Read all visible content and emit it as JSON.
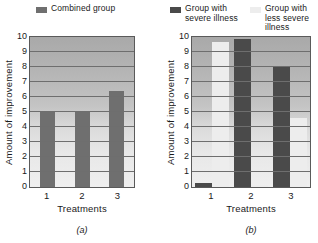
{
  "chart_data": [
    {
      "type": "bar",
      "panel": "(a)",
      "title": "",
      "categories": [
        "1",
        "2",
        "3"
      ],
      "series": [
        {
          "name": "Combined group",
          "values": [
            5.0,
            5.0,
            6.4
          ],
          "color": "#6f6f6f"
        }
      ],
      "xlabel": "Treatments",
      "ylabel": "Amount of improvement",
      "ylim": [
        0,
        10
      ],
      "yticks": [
        0,
        1,
        2,
        3,
        4,
        5,
        6,
        7,
        8,
        9,
        10
      ],
      "grid": true,
      "legend_position": "top"
    },
    {
      "type": "bar",
      "panel": "(b)",
      "title": "",
      "categories": [
        "1",
        "2",
        "3"
      ],
      "series": [
        {
          "name": "Group with\nsevere illness",
          "values": [
            0.3,
            9.85,
            8.0
          ],
          "color": "#4a4a4a"
        },
        {
          "name": "Group with\nless severe\nillness",
          "values": [
            9.7,
            0.15,
            4.6
          ],
          "color": "#ededed"
        }
      ],
      "xlabel": "Treatments",
      "ylabel": "Amount of improvement",
      "ylim": [
        0,
        10
      ],
      "yticks": [
        0,
        1,
        2,
        3,
        4,
        5,
        6,
        7,
        8,
        9,
        10
      ],
      "grid": true,
      "legend_position": "top"
    }
  ],
  "panel_a": {
    "legend": [
      {
        "label": "Combined group",
        "color": "#6f6f6f"
      }
    ],
    "ylabel": "Amount of improvement",
    "xlabel": "Treatments",
    "yticks": [
      "10",
      "9",
      "8",
      "7",
      "6",
      "5",
      "4",
      "3",
      "2",
      "1",
      "0"
    ],
    "xticks": [
      "1",
      "2",
      "3"
    ],
    "caption": "(a)"
  },
  "panel_b": {
    "legend": [
      {
        "label": "Group with\nsevere illness",
        "color": "#4a4a4a"
      },
      {
        "label": "Group with\nless severe\nillness",
        "color": "#ededed"
      }
    ],
    "ylabel": "Amount of improvement",
    "xlabel": "Treatments",
    "yticks": [
      "10",
      "9",
      "8",
      "7",
      "6",
      "5",
      "4",
      "3",
      "2",
      "1",
      "0"
    ],
    "xticks": [
      "1",
      "2",
      "3"
    ],
    "caption": "(b)"
  }
}
